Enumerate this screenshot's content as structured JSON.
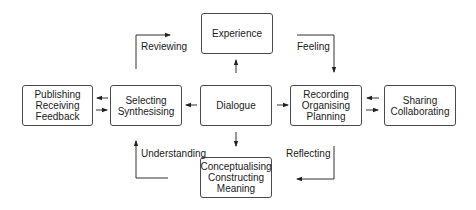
{
  "diagram": {
    "type": "process-cycle",
    "nodes": [
      {
        "id": "experience",
        "lines": [
          "Experience"
        ]
      },
      {
        "id": "publishing",
        "lines": [
          "Publishing",
          "Receiving",
          "Feedback"
        ]
      },
      {
        "id": "selecting",
        "lines": [
          "Selecting",
          "Synthesising"
        ]
      },
      {
        "id": "dialogue",
        "lines": [
          "Dialogue"
        ]
      },
      {
        "id": "recording",
        "lines": [
          "Recording",
          "Organising",
          "Planning"
        ]
      },
      {
        "id": "sharing",
        "lines": [
          "Sharing",
          "Collaborating"
        ]
      },
      {
        "id": "conceptualising",
        "lines": [
          "Conceptualising",
          "Constructing",
          "Meaning"
        ]
      }
    ],
    "edge_labels": {
      "reviewing": "Reviewing",
      "feeling": "Feeling",
      "understanding": "Understanding",
      "reflecting": "Reflecting"
    },
    "edges": [
      {
        "from": "dialogue",
        "to": "experience"
      },
      {
        "from": "dialogue",
        "to": "selecting"
      },
      {
        "from": "dialogue",
        "to": "recording"
      },
      {
        "from": "dialogue",
        "to": "conceptualising"
      },
      {
        "from": "selecting",
        "to": "publishing"
      },
      {
        "from": "publishing",
        "to": "selecting"
      },
      {
        "from": "sharing",
        "to": "recording"
      },
      {
        "from": "recording",
        "to": "sharing"
      },
      {
        "from": "selecting",
        "to": "experience",
        "label": "Reviewing"
      },
      {
        "from": "experience",
        "to": "recording",
        "label": "Feeling"
      },
      {
        "from": "recording",
        "to": "conceptualising",
        "label": "Reflecting"
      },
      {
        "from": "conceptualising",
        "to": "selecting",
        "label": "Understanding"
      }
    ]
  }
}
